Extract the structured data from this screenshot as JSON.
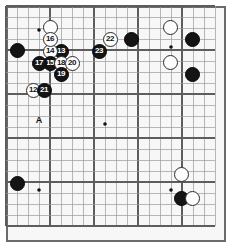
{
  "figure": {
    "name": "go-game-diagram",
    "board_size": 19,
    "visible_columns": 19,
    "visible_rows": 20,
    "background_color": "#f7f7f7",
    "frame_color": "#6b6b6b",
    "grid_color": "#9a9a9a",
    "grid_major_color": "#5d5d5d",
    "black_color": "#141414",
    "white_color": "#fdfdfd"
  },
  "labels": [
    {
      "text": "A",
      "x": 39,
      "y": 121
    }
  ],
  "star_points": [
    {
      "x": 39,
      "y": 30
    },
    {
      "x": 105,
      "y": 124
    },
    {
      "x": 171,
      "y": 47
    },
    {
      "x": 171,
      "y": 190
    },
    {
      "x": 39,
      "y": 190
    }
  ],
  "stones": [
    {
      "label": "",
      "color": "white",
      "x": 50,
      "y": 27,
      "d": 15
    },
    {
      "label": "",
      "color": "black",
      "x": 17,
      "y": 50,
      "d": 15
    },
    {
      "label": "",
      "color": "black",
      "x": 131,
      "y": 39,
      "d": 15
    },
    {
      "label": "",
      "color": "white",
      "x": 170,
      "y": 27,
      "d": 15
    },
    {
      "label": "",
      "color": "black",
      "x": 192,
      "y": 39,
      "d": 15
    },
    {
      "label": "",
      "color": "white",
      "x": 170,
      "y": 62,
      "d": 15
    },
    {
      "label": "",
      "color": "black",
      "x": 192,
      "y": 74,
      "d": 15
    },
    {
      "label": "",
      "color": "black",
      "x": 17,
      "y": 183,
      "d": 15
    },
    {
      "label": "",
      "color": "white",
      "x": 181,
      "y": 174,
      "d": 15
    },
    {
      "label": "",
      "color": "black",
      "x": 181,
      "y": 198,
      "d": 15
    },
    {
      "label": "",
      "color": "white",
      "x": 192,
      "y": 198,
      "d": 15
    },
    {
      "label": "12",
      "color": "white",
      "x": 33,
      "y": 90,
      "d": 15
    },
    {
      "label": "13",
      "color": "black",
      "x": 61,
      "y": 51,
      "d": 15
    },
    {
      "label": "14",
      "color": "white",
      "x": 50,
      "y": 51,
      "d": 15
    },
    {
      "label": "15",
      "color": "black",
      "x": 50,
      "y": 63,
      "d": 15
    },
    {
      "label": "16",
      "color": "white",
      "x": 50,
      "y": 39,
      "d": 15
    },
    {
      "label": "17",
      "color": "black",
      "x": 39,
      "y": 63,
      "d": 15
    },
    {
      "label": "18",
      "color": "white",
      "x": 61,
      "y": 63,
      "d": 15
    },
    {
      "label": "19",
      "color": "black",
      "x": 61,
      "y": 74,
      "d": 15
    },
    {
      "label": "20",
      "color": "white",
      "x": 72,
      "y": 63,
      "d": 15
    },
    {
      "label": "21",
      "color": "black",
      "x": 44,
      "y": 90,
      "d": 15
    },
    {
      "label": "22",
      "color": "white",
      "x": 110,
      "y": 39,
      "d": 15
    },
    {
      "label": "23",
      "color": "black",
      "x": 99,
      "y": 51,
      "d": 15
    }
  ]
}
